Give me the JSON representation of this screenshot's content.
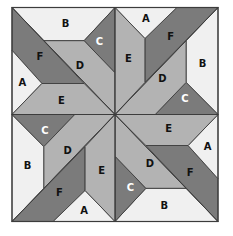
{
  "diagram": {
    "type": "quilt-block-template",
    "colors": {
      "light": "#f0f0f0",
      "mid": "#b3b3b3",
      "dark": "#7b7b7b",
      "outline": "#3c3c3c",
      "label_dark": "#111111",
      "label_light": "#ffffff"
    },
    "piece_tones": {
      "A": "light",
      "B": "light",
      "C": "dark",
      "D": "mid",
      "E": "mid",
      "F": "dark"
    },
    "quadrants": [
      {
        "name": "top-left",
        "rotation": 0,
        "labels": {
          "A": "A",
          "B": "B",
          "C": "C",
          "D": "D",
          "E": "E",
          "F": "F"
        }
      },
      {
        "name": "top-right",
        "rotation": 90,
        "labels": {
          "A": "A",
          "B": "B",
          "C": "C",
          "D": "D",
          "E": "E",
          "F": "F"
        }
      },
      {
        "name": "bottom-right",
        "rotation": 180,
        "labels": {
          "A": "A",
          "B": "B",
          "C": "C",
          "D": "D",
          "E": "E",
          "F": "F"
        }
      },
      {
        "name": "bottom-left",
        "rotation": 270,
        "labels": {
          "A": "A",
          "B": "B",
          "C": "C",
          "D": "D",
          "E": "E",
          "F": "F"
        }
      }
    ]
  }
}
